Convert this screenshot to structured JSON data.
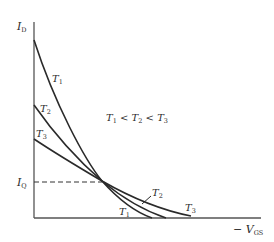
{
  "diagram": {
    "title": "",
    "y_axis": {
      "label_main": "I",
      "label_sub": "D"
    },
    "x_axis": {
      "label_prefix": "− ",
      "label_main": "V",
      "label_sub": "GS"
    },
    "quiescent": {
      "label_main": "I",
      "label_sub": "Q"
    },
    "relation": {
      "t1": "T",
      "t1_sub": "1",
      "lt1": " < ",
      "t2": "T",
      "t2_sub": "2",
      "lt2": " < ",
      "t3": "T",
      "t3_sub": "3"
    },
    "curves": [
      {
        "name": "T",
        "sub": "1",
        "label_top": "T1",
        "label_bottom": "T1"
      },
      {
        "name": "T",
        "sub": "2",
        "label_top": "T2",
        "label_bottom": "T2"
      },
      {
        "name": "T",
        "sub": "3",
        "label_top": "T3",
        "label_bottom": "T3"
      }
    ],
    "colors": {
      "line": "#2a2a2a",
      "background": "#ffffff"
    }
  }
}
